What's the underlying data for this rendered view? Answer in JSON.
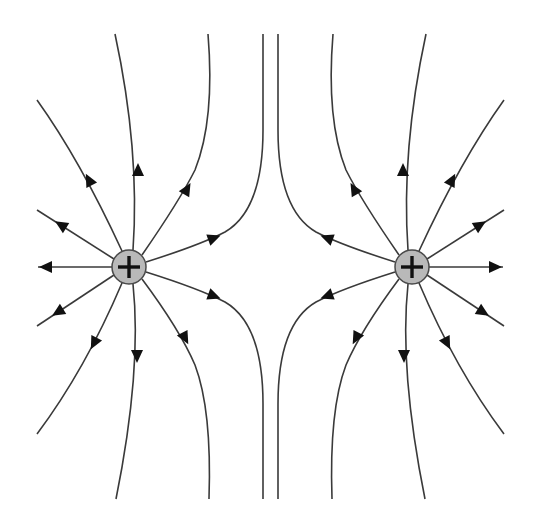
{
  "diagram": {
    "background_color": "#ffffff",
    "line_color": "#3a3a3a",
    "arrow_color": "#111111",
    "charge_fill_color": "#b9b9b9",
    "charges": [
      {
        "id": "left-charge",
        "sign": "+",
        "label": "+",
        "cx": 129,
        "cy": 267,
        "r": 17
      },
      {
        "id": "right-charge",
        "sign": "+",
        "label": "+",
        "cx": 412,
        "cy": 267,
        "r": 17
      }
    ],
    "field_direction": "outward from positive charges",
    "lines_per_charge": 11,
    "neutral_gap": "vertical pair of field lines near x=263 and x=278 separating the charges"
  }
}
